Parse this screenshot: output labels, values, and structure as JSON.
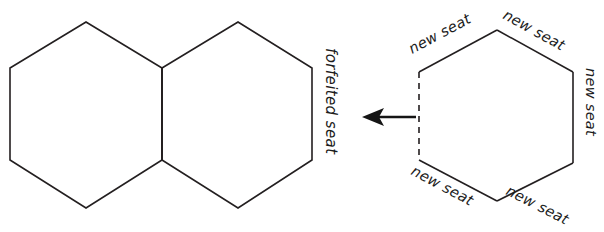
{
  "figure": {
    "type": "diagram",
    "background_color": "#ffffff",
    "stroke_color": "#231f20",
    "arrow_color": "#151515"
  },
  "shapes": {
    "left_group": {
      "name": "double-hexagon",
      "hexagons": [
        {
          "id": "hex-left",
          "points": "10,68 86,22 162,68 162,160 86,208 10,160"
        },
        {
          "id": "hex-right",
          "points": "162,68 238,22 312,68 312,160 238,208 162,160"
        }
      ],
      "shared_edge": {
        "id": "shared-vertical-edge",
        "x1": 162,
        "y1": 68,
        "x2": 162,
        "y2": 160
      },
      "labels": [
        {
          "id": "forfeited-seat-label",
          "text": "forfeited seat",
          "x": 326,
          "y": 48,
          "rotate": 90
        }
      ]
    },
    "arrow": {
      "id": "transition-arrow",
      "direction": "left",
      "shaft": {
        "x1": 416,
        "y1": 117,
        "x2": 374,
        "y2": 117
      },
      "head": "362,117 384,108 379,117 384,126"
    },
    "right_group": {
      "name": "single-hexagon",
      "hexagon": {
        "id": "hex-new",
        "points": "419,72 497,30 573,72 573,163 497,201 419,160"
      },
      "dashed_edge": {
        "id": "dashed-left-edge",
        "x1": 419,
        "y1": 72,
        "x2": 419,
        "y2": 160
      },
      "solid_edges": [
        {
          "id": "edge-top-left",
          "x1": 419,
          "y1": 72,
          "x2": 497,
          "y2": 30
        },
        {
          "id": "edge-top-right",
          "x1": 497,
          "y1": 30,
          "x2": 573,
          "y2": 72
        },
        {
          "id": "edge-right",
          "x1": 573,
          "y1": 72,
          "x2": 573,
          "y2": 163
        },
        {
          "id": "edge-bottom-right",
          "x1": 573,
          "y1": 163,
          "x2": 497,
          "y2": 201
        },
        {
          "id": "edge-bottom-left",
          "x1": 497,
          "y1": 201,
          "x2": 419,
          "y2": 160
        }
      ],
      "labels": [
        {
          "id": "new-seat-top-left",
          "text": "new seat",
          "x": 412,
          "y": 54,
          "rotate": -28
        },
        {
          "id": "new-seat-top-right",
          "text": "new seat",
          "x": 502,
          "y": 18,
          "rotate": 29
        },
        {
          "id": "new-seat-right",
          "text": "new seat",
          "x": 586,
          "y": 68,
          "rotate": 90
        },
        {
          "id": "new-seat-bottom-right",
          "text": "new seat",
          "x": 505,
          "y": 194,
          "rotate": -27
        },
        {
          "id": "new-seat-bottom-left",
          "text": "new seat",
          "x": 410,
          "y": 174,
          "rotate": 28
        }
      ]
    }
  }
}
